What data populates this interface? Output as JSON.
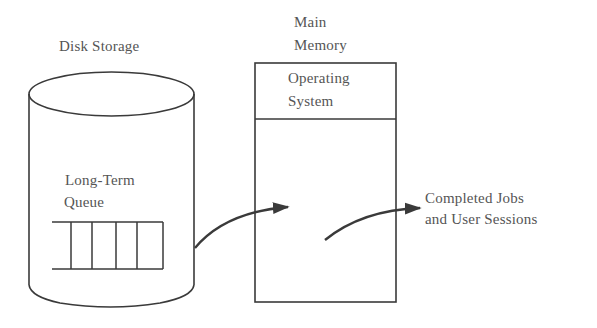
{
  "diagram": {
    "type": "scheduling-flow",
    "colors": {
      "stroke": "#3a3a3a",
      "text": "#555555",
      "background": "#ffffff"
    },
    "disk": {
      "title": "Disk Storage",
      "queue": {
        "label_line1": "Long-Term",
        "label_line2": "Queue",
        "slots": 5
      }
    },
    "memory": {
      "title_line1": "Main",
      "title_line2": "Memory",
      "os_line1": "Operating",
      "os_line2": "System"
    },
    "output": {
      "line1": "Completed Jobs",
      "line2": "and User Sessions"
    },
    "arrows": [
      {
        "from": "long-term-queue",
        "to": "main-memory"
      },
      {
        "from": "main-memory",
        "to": "completed-jobs"
      }
    ]
  }
}
